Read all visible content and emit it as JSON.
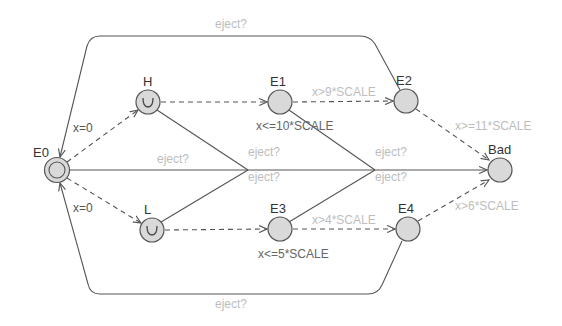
{
  "diagram": {
    "type": "timed-automaton",
    "nodes": [
      {
        "id": "E0",
        "label": "E0",
        "initial": true,
        "urgent": false,
        "x": 57,
        "y": 170
      },
      {
        "id": "H",
        "label": "H",
        "initial": false,
        "urgent": true,
        "x": 148,
        "y": 102
      },
      {
        "id": "L",
        "label": "L",
        "initial": false,
        "urgent": true,
        "x": 152,
        "y": 230
      },
      {
        "id": "E1",
        "label": "E1",
        "initial": false,
        "urgent": false,
        "x": 280,
        "y": 102,
        "invariant": "x<=10*SCALE"
      },
      {
        "id": "E2",
        "label": "E2",
        "initial": false,
        "urgent": false,
        "x": 406,
        "y": 101
      },
      {
        "id": "E3",
        "label": "E3",
        "initial": false,
        "urgent": false,
        "x": 280,
        "y": 229,
        "invariant": "x<=5*SCALE"
      },
      {
        "id": "E4",
        "label": "E4",
        "initial": false,
        "urgent": false,
        "x": 408,
        "y": 229
      },
      {
        "id": "Bad",
        "label": "Bad",
        "initial": false,
        "urgent": false,
        "x": 500,
        "y": 170
      }
    ],
    "urgent_glyph": "U",
    "edges": {
      "e0_h": {
        "label": "x=0",
        "style": "dashed"
      },
      "e0_l": {
        "label": "x=0",
        "style": "dashed"
      },
      "h_e1": {
        "label": "",
        "style": "dashed"
      },
      "e1_e2": {
        "label": "x>9*SCALE",
        "style": "dashed"
      },
      "e2_bad": {
        "label": "x>=11*SCALE",
        "style": "dashed"
      },
      "l_e3": {
        "label": "",
        "style": "dashed"
      },
      "e3_e4": {
        "label": "x>4*SCALE",
        "style": "dashed"
      },
      "e4_bad": {
        "label": "x>6*SCALE",
        "style": "dashed"
      },
      "e2_e0_top": {
        "label": "eject?",
        "style": "solid"
      },
      "e4_e0_bottom": {
        "label": "eject?",
        "style": "solid"
      },
      "e0_bad": {
        "label": "eject?",
        "style": "solid"
      },
      "h_join1": {
        "label": "eject?",
        "style": "solid"
      },
      "l_join1": {
        "label": "eject?",
        "style": "solid"
      },
      "e1_join2": {
        "label": "eject?",
        "style": "solid"
      },
      "e3_join2": {
        "label": "eject?",
        "style": "solid"
      }
    }
  }
}
